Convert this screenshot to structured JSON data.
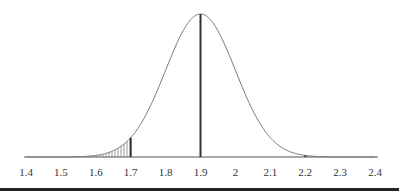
{
  "chart_data": {
    "type": "area",
    "title": "",
    "xlabel": "",
    "ylabel": "",
    "distribution": "normal",
    "mean": 1.9,
    "std_dev": 0.1,
    "xlim": [
      1.4,
      2.4
    ],
    "x_ticks": [
      "1.4",
      "1.5",
      "1.6",
      "1.7",
      "1.8",
      "1.9",
      "2",
      "2.1",
      "2.2",
      "2.3",
      "2.4"
    ],
    "vertical_lines": [
      {
        "x": 1.7,
        "role": "left-cutoff"
      },
      {
        "x": 1.9,
        "role": "mean"
      },
      {
        "x": 2.2,
        "role": "right-cutoff"
      }
    ],
    "shaded_regions": [
      {
        "from": 1.4,
        "to": 1.7,
        "pattern": "vertical-hatch"
      },
      {
        "from": 2.2,
        "to": 2.4,
        "pattern": "vertical-hatch"
      }
    ],
    "grid": false,
    "legend": null
  },
  "colors": {
    "curve": "#777777",
    "lines": "#333333",
    "hatch": "#999999",
    "axis": "#555555",
    "bottom_rule": "#222222"
  }
}
